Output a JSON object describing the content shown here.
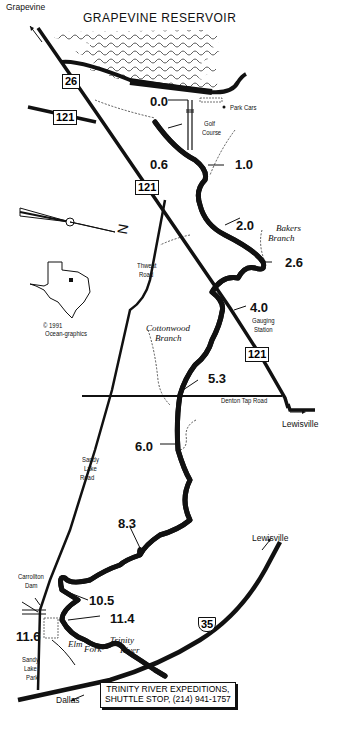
{
  "map": {
    "title": "GRAPEVINE RESERVOIR",
    "towns": {
      "grapevine": "Grapevine",
      "lewisville_east": "Lewisville",
      "lewisville_ne": "Lewisville",
      "dallas": "Dallas"
    },
    "highways": {
      "sh26": "26",
      "sh121_west": "121",
      "sh121_mid": "121",
      "sh121_south": "121",
      "i35": "35"
    },
    "roads": {
      "thweat": [
        "Thweat",
        "Road"
      ],
      "denton_tap": "Denton Tap Road",
      "sandy_lake": [
        "Sandy",
        "Lake",
        "Road"
      ]
    },
    "landmarks": {
      "park_cars": "Park Cars",
      "golf_course": [
        "Golf",
        "Course"
      ],
      "gauging_station": [
        "Gauging",
        "Station"
      ],
      "carrollton_dam": [
        "Carrollton",
        "Dam"
      ],
      "sandy_lake_park": [
        "Sandy",
        "Lake",
        "Park"
      ]
    },
    "streams": {
      "bakers_branch": [
        "Bakers",
        "Branch"
      ],
      "cottonwood_branch": [
        "Cottonwood",
        "Branch"
      ],
      "elm_fork": [
        "Elm",
        "Fork"
      ],
      "trinity_river": [
        "Trinity",
        "River"
      ]
    },
    "river_miles": [
      "0.0",
      "0.6",
      "1.0",
      "2.0",
      "2.6",
      "4.0",
      "5.3",
      "6.0",
      "8.3",
      "10.5",
      "11.4",
      "11.6"
    ],
    "inset": {
      "copyright": "© 1991",
      "credit": "Ocean-graphics"
    },
    "compass": {
      "north_label": "N"
    },
    "callout": {
      "line1": "TRINITY RIVER EXPEDITIONS,",
      "line2": "SHUTTLE STOP, (214) 941-1757"
    },
    "colors": {
      "ink": "#111111",
      "paper": "#ffffff"
    }
  }
}
